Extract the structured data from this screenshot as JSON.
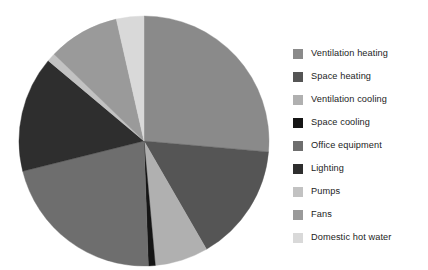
{
  "chart_data": {
    "type": "pie",
    "title": "",
    "subtitle": "",
    "xlabel": "",
    "ylabel": "",
    "legend_position": "right",
    "grid": false,
    "start_angle_deg": 0,
    "direction": "clockwise",
    "categories": [
      "Ventilation heating",
      "Space heating",
      "Ventilation cooling",
      "Space cooling",
      "Office equipment",
      "Lighting",
      "Pumps",
      "Fans",
      "Domestic hot water"
    ],
    "values": [
      26.4,
      15.3,
      6.9,
      0.9,
      21.7,
      15.0,
      1.1,
      9.2,
      3.5
    ],
    "unit": "%",
    "colors": [
      "#8a8a8a",
      "#555555",
      "#b0b0b0",
      "#151515",
      "#6e6e6e",
      "#2e2e2e",
      "#c2c2c2",
      "#9a9a9a",
      "#d9d9d9"
    ],
    "slices": [
      {
        "label": "Ventilation heating",
        "value": 26.4,
        "color": "#8a8a8a",
        "start_deg": 0,
        "end_deg": 95.0
      },
      {
        "label": "Space heating",
        "value": 15.3,
        "color": "#555555",
        "start_deg": 95.0,
        "end_deg": 150.0
      },
      {
        "label": "Ventilation cooling",
        "value": 6.9,
        "color": "#b0b0b0",
        "start_deg": 150.0,
        "end_deg": 174.8
      },
      {
        "label": "Space cooling",
        "value": 0.9,
        "color": "#151515",
        "start_deg": 174.8,
        "end_deg": 178.0
      },
      {
        "label": "Office equipment",
        "value": 21.7,
        "color": "#6e6e6e",
        "start_deg": 178.0,
        "end_deg": 256.0
      },
      {
        "label": "Lighting",
        "value": 15.0,
        "color": "#2e2e2e",
        "start_deg": 256.0,
        "end_deg": 310.0
      },
      {
        "label": "Pumps",
        "value": 1.1,
        "color": "#c2c2c2",
        "start_deg": 310.0,
        "end_deg": 314.0
      },
      {
        "label": "Fans",
        "value": 9.2,
        "color": "#9a9a9a",
        "start_deg": 314.0,
        "end_deg": 347.2
      },
      {
        "label": "Domestic hot water",
        "value": 3.5,
        "color": "#d9d9d9",
        "start_deg": 347.2,
        "end_deg": 360.0
      }
    ]
  },
  "legend": {
    "items": [
      {
        "label": "Ventilation heating",
        "color": "#8a8a8a"
      },
      {
        "label": "Space heating",
        "color": "#555555"
      },
      {
        "label": "Ventilation cooling",
        "color": "#b0b0b0"
      },
      {
        "label": "Space cooling",
        "color": "#151515"
      },
      {
        "label": "Office equipment",
        "color": "#6e6e6e"
      },
      {
        "label": "Lighting",
        "color": "#2e2e2e"
      },
      {
        "label": "Pumps",
        "color": "#c2c2c2"
      },
      {
        "label": "Fans",
        "color": "#9a9a9a"
      },
      {
        "label": "Domestic hot water",
        "color": "#d9d9d9"
      }
    ]
  },
  "canvas": {
    "background": "#ffffff"
  }
}
